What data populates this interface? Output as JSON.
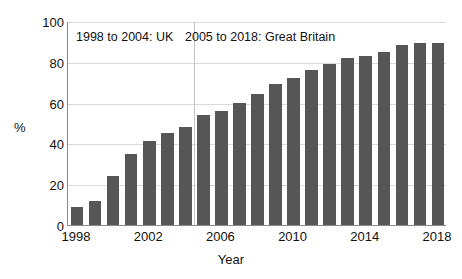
{
  "chart_data": {
    "type": "bar",
    "title": "",
    "xlabel": "Year",
    "ylabel": "%",
    "ylim": [
      0,
      100
    ],
    "ytick_values": [
      0,
      20,
      40,
      60,
      80,
      100
    ],
    "ytick_labels": [
      "0",
      "20",
      "40",
      "60",
      "80",
      "100"
    ],
    "xtick_labels": [
      "1998",
      "2002",
      "2006",
      "2010",
      "2014",
      "2018"
    ],
    "xtick_categories": [
      "1998",
      "2002",
      "2006",
      "2010",
      "2014",
      "2018"
    ],
    "grid": "horizontal",
    "legend": "none",
    "bar_color": "#565656",
    "categories": [
      "1998",
      "1999",
      "2000",
      "2001",
      "2002",
      "2003",
      "2004",
      "2005",
      "2006",
      "2007",
      "2008",
      "2009",
      "2010",
      "2011",
      "2012",
      "2013",
      "2014",
      "2015",
      "2016",
      "2017",
      "2018"
    ],
    "values": [
      9,
      12,
      24,
      35,
      41,
      45,
      48,
      54,
      56,
      60,
      64,
      69,
      72,
      76,
      79,
      82,
      83,
      85,
      88,
      89,
      89
    ],
    "annotations": [
      {
        "text": "1998 to 2004: UK",
        "position": "top-left"
      },
      {
        "text": "2005 to 2018: Great Britain",
        "position": "top-right"
      }
    ],
    "divider": {
      "between": "2004|2005",
      "orientation": "vertical"
    }
  }
}
